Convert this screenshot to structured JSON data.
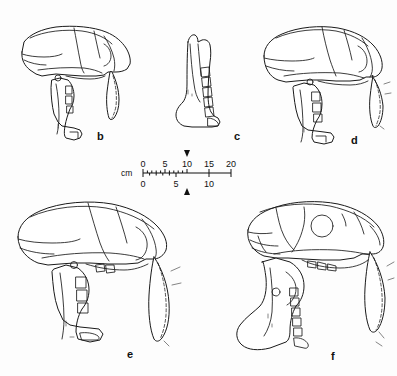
{
  "figure": {
    "type": "scientific-illustration",
    "background_color": "#fdfdfd",
    "ink_color": "#1a1a1a"
  },
  "panels": [
    {
      "id": "b",
      "label": "b",
      "content": "skull with mandible, lateral view, saber canine",
      "label_x": 97,
      "label_y": 131
    },
    {
      "id": "c",
      "label": "c",
      "content": "isolated mandible (hemimandible) with tooth row, lateral view",
      "label_x": 234,
      "label_y": 131
    },
    {
      "id": "d",
      "label": "d",
      "content": "skull with mandible, lateral view, saber canine",
      "label_x": 351,
      "label_y": 135
    },
    {
      "id": "e",
      "label": "e",
      "content": "skull with mandible, lateral view, elongate saber canine",
      "label_x": 127,
      "label_y": 349
    },
    {
      "id": "f",
      "label": "f",
      "content": "skull with deep flanged mandible, lateral view, saber canine",
      "label_x": 331,
      "label_y": 351
    }
  ],
  "scale_bar": {
    "unit_label": "cm",
    "upper_scale": {
      "major_ticks": [
        "0",
        "5",
        "10",
        "15",
        "20"
      ],
      "max": 20,
      "minor_ticks_between": 4
    },
    "lower_scale": {
      "major_ticks": [
        "0",
        "5",
        "10"
      ],
      "max": 10
    },
    "markers": {
      "top_arrow": "triangle-up at 10 on upper scale",
      "bottom_arrow": "triangle-down at 10 on upper scale"
    }
  }
}
